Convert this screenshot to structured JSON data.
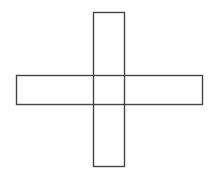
{
  "diagram": {
    "type": "cross-shape",
    "stroke_color": "#444444",
    "fill_color": "none",
    "shapes": [
      {
        "name": "vertical-bar",
        "x": 93.5,
        "y": 12.5,
        "width": 31,
        "height": 154
      },
      {
        "name": "horizontal-bar",
        "x": 16.5,
        "y": 75.5,
        "width": 186,
        "height": 29
      }
    ]
  }
}
